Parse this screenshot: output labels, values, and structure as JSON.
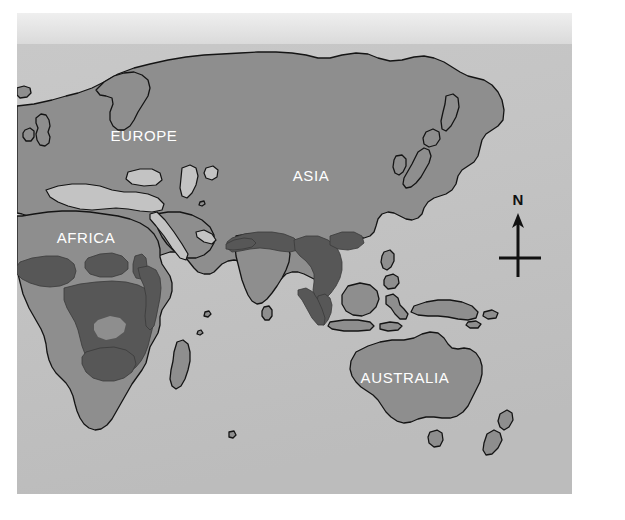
{
  "figure": {
    "kind": "world-distribution-map",
    "projection_extent": "Eastern Hemisphere: Europe, Africa, Asia, Australia",
    "page_background": "#ffffff"
  },
  "map": {
    "frame": {
      "x": 17,
      "y": 44,
      "width": 555,
      "height": 450
    },
    "colors": {
      "ocean": "#c3c3c3",
      "ocean_shadow": "#b9b9b9",
      "land": "#8e8e8e",
      "highlight": "#575757",
      "coastline": "#141414",
      "label_text": "#ffffff",
      "compass": "#111111",
      "page": "#ffffff",
      "top_band": "#e4e4e4"
    },
    "labels": [
      {
        "text": "EUROPE",
        "x": 144,
        "y": 141,
        "size": 15
      },
      {
        "text": "ASIA",
        "x": 311,
        "y": 181,
        "size": 15
      },
      {
        "text": "AFRICA",
        "x": 86,
        "y": 243,
        "size": 15
      },
      {
        "text": "AUSTRALIA",
        "x": 405,
        "y": 383,
        "size": 15
      }
    ],
    "compass": {
      "label": "N",
      "label_x": 518,
      "label_y": 205,
      "label_size": 15,
      "shaft_x": 518,
      "shaft_top": 216,
      "shaft_bottom": 277,
      "crossbar_y": 258,
      "crossbar_left": 499,
      "crossbar_right": 541,
      "stroke_width": 3
    }
  },
  "legend": {
    "highlight_meaning": "shaded distribution range",
    "highlight_regions": [
      "Sub-Saharan Africa",
      "Sahel belt",
      "Central Africa",
      "East Africa",
      "Southern Africa",
      "Northern India",
      "Himalayan belt",
      "Indochina",
      "Malay Peninsula",
      "Sumatra"
    ]
  }
}
